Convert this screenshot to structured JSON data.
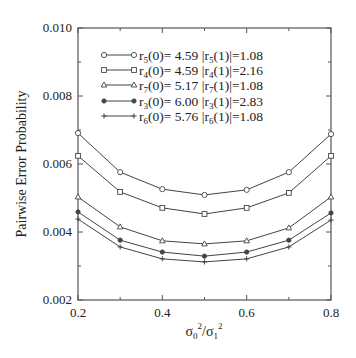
{
  "chart_data": {
    "type": "line",
    "title": "",
    "xlabel": "σ0²/σ1²",
    "ylabel": "Pairwise Error Probability",
    "xlim": [
      0.2,
      0.8
    ],
    "ylim": [
      0.002,
      0.01
    ],
    "x": [
      0.2,
      0.3,
      0.4,
      0.5,
      0.6,
      0.7,
      0.8
    ],
    "x_ticks": [
      "0.2",
      "0.4",
      "0.6",
      "0.8"
    ],
    "y_ticks": [
      "0.002",
      "0.004",
      "0.006",
      "0.008",
      "0.010"
    ],
    "grid": false,
    "legend_position": "upper center (inside plot)",
    "series": [
      {
        "name": "r5(0)= 4.59  |r5(1)|=1.08",
        "label_parts": {
          "r": "5",
          "r0": "4.59",
          "r1": "1.08"
        },
        "marker": "circle",
        "values": [
          0.00691,
          0.00576,
          0.00526,
          0.00509,
          0.00524,
          0.00576,
          0.00688
        ]
      },
      {
        "name": "r4(0)= 4.59  |r4(1)|=2.16",
        "label_parts": {
          "r": "4",
          "r0": "4.59",
          "r1": "2.16"
        },
        "marker": "square",
        "values": [
          0.00624,
          0.00518,
          0.00471,
          0.00453,
          0.00471,
          0.00515,
          0.00624
        ]
      },
      {
        "name": "r7(0)= 5.17  |r7(1)|=1.08",
        "label_parts": {
          "r": "7",
          "r0": "5.17",
          "r1": "1.08"
        },
        "marker": "triangle",
        "values": [
          0.00503,
          0.00415,
          0.00374,
          0.00365,
          0.00374,
          0.00412,
          0.00503
        ]
      },
      {
        "name": "r3(0)= 6.00  |r3(1)|=2.83",
        "label_parts": {
          "r": "3",
          "r0": "6.00",
          "r1": "2.83"
        },
        "marker": "filled-circle",
        "values": [
          0.00459,
          0.00376,
          0.00341,
          0.00329,
          0.00341,
          0.00376,
          0.00456
        ]
      },
      {
        "name": "r6(0)= 5.76  |r6(1)|=1.08",
        "label_parts": {
          "r": "6",
          "r0": "5.76",
          "r1": "1.08"
        },
        "marker": "plus",
        "values": [
          0.00438,
          0.00356,
          0.00321,
          0.00312,
          0.00321,
          0.00356,
          0.00435
        ]
      }
    ]
  },
  "colors": {
    "line": "#444444",
    "axis": "#555555",
    "text": "#222222"
  }
}
